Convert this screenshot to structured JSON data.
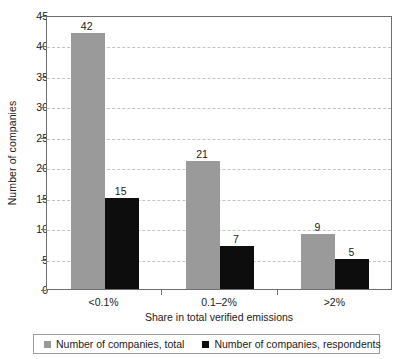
{
  "chart_data": {
    "type": "bar",
    "title": "",
    "xlabel": "Share in total verified emissions",
    "ylabel": "Number of companies",
    "categories": [
      "<0.1%",
      "0.1–2%",
      ">2%"
    ],
    "series": [
      {
        "name": "Number of companies, total",
        "color": "#9a9a9a",
        "values": [
          42,
          21,
          9
        ]
      },
      {
        "name": "Number of companies, respondents",
        "color": "#0d0d0d",
        "values": [
          15,
          7,
          5
        ]
      }
    ],
    "ylim": [
      0,
      45
    ],
    "ytick_step": 5,
    "yticks": [
      0,
      5,
      10,
      15,
      20,
      25,
      30,
      35,
      40,
      45
    ],
    "ytick_labels": [
      "0",
      "5",
      "10",
      "15",
      "20",
      "25",
      "30",
      "35",
      "40",
      "45"
    ],
    "grid": "horizontal-dashed",
    "legend_position": "bottom",
    "data_labels": [
      {
        "category": "<0.1%",
        "series": "Number of companies, total",
        "value": "42"
      },
      {
        "category": "<0.1%",
        "series": "Number of companies, respondents",
        "value": "15"
      },
      {
        "category": "0.1–2%",
        "series": "Number of companies, total",
        "value": "21"
      },
      {
        "category": "0.1–2%",
        "series": "Number of companies, respondents",
        "value": "7"
      },
      {
        "category": ">2%",
        "series": "Number of companies, total",
        "value": "9"
      },
      {
        "category": ">2%",
        "series": "Number of companies, respondents",
        "value": "5"
      }
    ]
  },
  "legend": {
    "items": [
      {
        "label": "Number of companies, total"
      },
      {
        "label": "Number of companies, respondents"
      }
    ]
  }
}
